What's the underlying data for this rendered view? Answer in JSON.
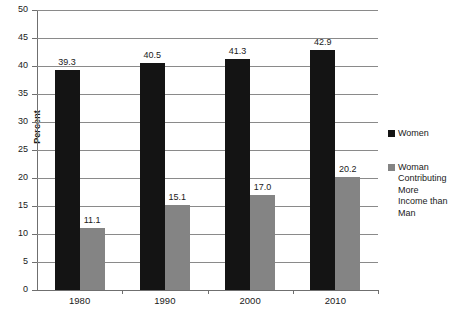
{
  "chart_data": {
    "type": "bar",
    "title": "",
    "xlabel": "",
    "ylabel": "Percent",
    "ylim": [
      0,
      50
    ],
    "ytick_step": 5,
    "yticks": [
      "50",
      "45",
      "40",
      "35",
      "30",
      "25",
      "20",
      "15",
      "10",
      "5",
      "0"
    ],
    "categories": [
      "1980",
      "1990",
      "2000",
      "2010"
    ],
    "grid": true,
    "legend_position": "right",
    "series": [
      {
        "name": "Women",
        "color": "#141414",
        "values": [
          39.3,
          40.5,
          41.3,
          42.9
        ],
        "labels": [
          "39.3",
          "40.5",
          "41.3",
          "42.9"
        ]
      },
      {
        "name": "Woman Contributing More Income than Man",
        "color": "#848484",
        "values": [
          11.1,
          15.1,
          17.0,
          20.2
        ],
        "labels": [
          "11.1",
          "15.1",
          "17.0",
          "20.2"
        ]
      }
    ]
  },
  "legend": {
    "items": [
      {
        "label": "Women"
      },
      {
        "label": "Woman Contributing More Income than Man"
      }
    ]
  },
  "axis": {
    "y_title": "Percent"
  }
}
